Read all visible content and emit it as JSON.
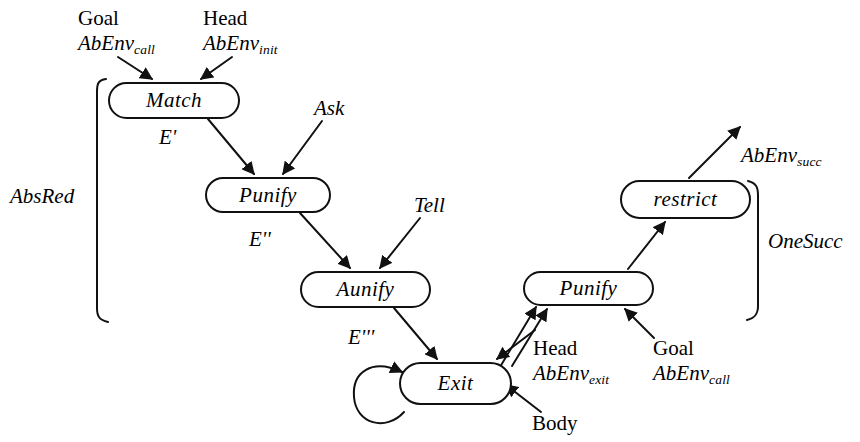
{
  "diagram": {
    "background_color": "#ffffff",
    "line_color": "#111111",
    "nodes": [
      {
        "id": "match",
        "label": "Match",
        "x": 108,
        "y": 82,
        "w": 132,
        "h": 37
      },
      {
        "id": "punify1",
        "label": "Punify",
        "x": 205,
        "y": 177,
        "w": 126,
        "h": 36
      },
      {
        "id": "aunify",
        "label": "Aunify",
        "x": 300,
        "y": 271,
        "w": 131,
        "h": 37
      },
      {
        "id": "exit",
        "label": "Exit",
        "x": 399,
        "y": 362,
        "w": 113,
        "h": 43
      },
      {
        "id": "punify2",
        "label": "Punify",
        "x": 523,
        "y": 271,
        "w": 131,
        "h": 35
      },
      {
        "id": "restrict",
        "label": "restrict",
        "x": 620,
        "y": 180,
        "w": 131,
        "h": 39
      }
    ],
    "edge_labels": {
      "e_prime": "E'",
      "e_double_prime": "E''",
      "e_triple_prime": "E'''",
      "ask": "Ask",
      "tell": "Tell",
      "body": "Body"
    },
    "input_annotations": [
      {
        "id": "goal-init",
        "line1": "Goal",
        "var": "AbEnv",
        "sub": "call",
        "target": "match"
      },
      {
        "id": "head-init",
        "line1": "Head",
        "var": "AbEnv",
        "sub": "init",
        "target": "match"
      },
      {
        "id": "head-exit",
        "line1": "Head",
        "var": "AbEnv",
        "sub": "exit",
        "target": "punify2"
      },
      {
        "id": "goal-call2",
        "line1": "Goal",
        "var": "AbEnv",
        "sub": "call",
        "target": "punify2"
      }
    ],
    "output_annotation": {
      "id": "abenv-succ",
      "var": "AbEnv",
      "sub": "succ"
    },
    "brackets": [
      {
        "id": "absred",
        "label": "AbsRed",
        "x": 97,
        "top": 78,
        "bottom": 322,
        "side": "left",
        "label_x": 10,
        "label_y": 187
      },
      {
        "id": "onesucc",
        "label": "OneSucc",
        "x": 758,
        "top": 180,
        "bottom": 320,
        "side": "right",
        "label_x": 768,
        "label_y": 230
      }
    ],
    "self_loop": {
      "on": "exit",
      "cx": 384,
      "cy": 397,
      "r": 27
    }
  }
}
